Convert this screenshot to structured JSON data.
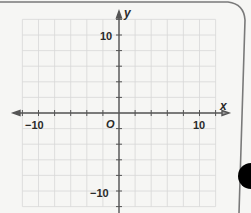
{
  "chart_data": {
    "type": "scatter",
    "title": "",
    "xlabel": "x",
    "ylabel": "y",
    "origin_label": "O",
    "xlim": [
      -12,
      12
    ],
    "ylim": [
      -12,
      12
    ],
    "grid": true,
    "grid_step": 2,
    "x_tick_labels": [
      {
        "value": -10,
        "label": "−10"
      },
      {
        "value": 10,
        "label": "10"
      }
    ],
    "y_tick_labels": [
      {
        "value": 10,
        "label": "10"
      },
      {
        "value": -10,
        "label": "−10"
      }
    ],
    "points": []
  },
  "page": {
    "card_edge_color": "#7a7a7a",
    "tab_marker_color": "#000000",
    "grid_color": "#d8d8d8",
    "axis_color": "#555555"
  },
  "labels": {
    "x_axis": "x",
    "y_axis": "y",
    "origin": "O",
    "x_neg10": "−10",
    "x_pos10": "10",
    "y_pos10": "10",
    "y_neg10": "−10"
  }
}
